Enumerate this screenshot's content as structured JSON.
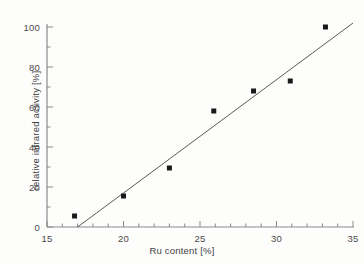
{
  "chart_data": {
    "type": "scatter",
    "title": "",
    "xlabel": "Ru content [%]",
    "ylabel": "relative infrared activity [%]",
    "xlim": [
      15,
      35
    ],
    "ylim": [
      0,
      100
    ],
    "x_major_ticks": [
      15,
      20,
      25,
      30,
      35
    ],
    "y_major_ticks": [
      0,
      20,
      40,
      60,
      80,
      100
    ],
    "x_minor_interval": 1,
    "y_minor_interval": 10,
    "x_tick_labels": [
      "15",
      "20",
      "25",
      "30",
      "35"
    ],
    "y_tick_labels": [
      "0",
      "20",
      "40",
      "60",
      "80",
      "100"
    ],
    "grid": false,
    "legend": false,
    "marker": "filled-square",
    "marker_color": "#1a1a1a",
    "axis_color": "#8a8a8a",
    "series": [
      {
        "name": "relative infrared activity",
        "points": [
          {
            "x": 16.8,
            "y": 5.5
          },
          {
            "x": 20.0,
            "y": 15.5
          },
          {
            "x": 23.0,
            "y": 29.5
          },
          {
            "x": 25.9,
            "y": 58.0
          },
          {
            "x": 28.5,
            "y": 68.0
          },
          {
            "x": 30.9,
            "y": 73.0
          },
          {
            "x": 33.2,
            "y": 100.0
          }
        ]
      }
    ],
    "fit_line": {
      "name": "linear fit",
      "color": "#5a5a5a",
      "x_start": 17.0,
      "y_start": 0.0,
      "x_end": 35.0,
      "y_end": 102.0
    }
  }
}
